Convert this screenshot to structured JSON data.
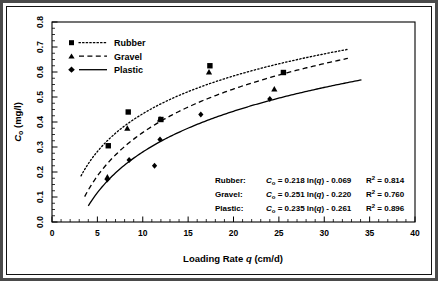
{
  "chart_data": {
    "type": "scatter",
    "title": "",
    "xlabel": "Loading Rate q  (cm/d)",
    "ylabel": "Cₒ  (mg/l)",
    "xlim": [
      0,
      40
    ],
    "ylim": [
      0.0,
      0.8
    ],
    "xticks": [
      0,
      5,
      10,
      15,
      20,
      25,
      30,
      35,
      40
    ],
    "xticklabels": [
      "0",
      "5",
      "10",
      "15",
      "20",
      "25",
      "30",
      "35",
      "40"
    ],
    "yticks": [
      0.0,
      0.1,
      0.2,
      0.3,
      0.4,
      0.5,
      0.6,
      0.7,
      0.8
    ],
    "yticklabels": [
      "0.0",
      "0.1",
      "0.2",
      "0.3",
      "0.4",
      "0.5",
      "0.6",
      "0.7",
      "0.8"
    ],
    "x_minor_step": 1,
    "y_minor_step": 0.025,
    "grid": false,
    "legend_position": "top-left",
    "series": [
      {
        "name": "Rubber",
        "marker": "square",
        "line": "dotted",
        "points": [
          {
            "x": 6.2,
            "y": 0.305
          },
          {
            "x": 8.4,
            "y": 0.44
          },
          {
            "x": 12.0,
            "y": 0.41
          },
          {
            "x": 17.4,
            "y": 0.625
          },
          {
            "x": 25.5,
            "y": 0.598
          }
        ],
        "fit": {
          "slope": 0.218,
          "intercept": -0.069,
          "r2": 0.814,
          "x_start": 3.2,
          "x_end": 32.6
        }
      },
      {
        "name": "Gravel",
        "marker": "triangle",
        "line": "dashed",
        "points": [
          {
            "x": 6.1,
            "y": 0.18
          },
          {
            "x": 8.3,
            "y": 0.375
          },
          {
            "x": 11.9,
            "y": 0.412
          },
          {
            "x": 17.3,
            "y": 0.6
          },
          {
            "x": 24.5,
            "y": 0.532
          }
        ],
        "fit": {
          "slope": 0.251,
          "intercept": -0.22,
          "r2": 0.76,
          "x_start": 3.6,
          "x_end": 32.6
        }
      },
      {
        "name": "Plastic",
        "marker": "diamond",
        "line": "solid",
        "points": [
          {
            "x": 6.1,
            "y": 0.17
          },
          {
            "x": 8.5,
            "y": 0.248
          },
          {
            "x": 11.3,
            "y": 0.225
          },
          {
            "x": 11.9,
            "y": 0.33
          },
          {
            "x": 16.4,
            "y": 0.43
          },
          {
            "x": 24.0,
            "y": 0.492
          }
        ],
        "fit": {
          "slope": 0.235,
          "intercept": -0.261,
          "r2": 0.896,
          "x_start": 4.0,
          "x_end": 34.1
        }
      }
    ]
  },
  "legend": {
    "items": [
      {
        "label": "Rubber"
      },
      {
        "label": "Gravel"
      },
      {
        "label": "Plastic"
      }
    ]
  },
  "equations": {
    "rows": [
      {
        "label": "Rubber:",
        "var": "C",
        "sub": "o",
        "eq_mid": " = 0.218 ln(",
        "eq_var": "q",
        "eq_tail": ") - 0.069",
        "r2_label": "R",
        "r2_exp": "2",
        "r2_value": " = 0.814"
      },
      {
        "label": "Gravel:",
        "var": "C",
        "sub": "o",
        "eq_mid": " = 0.251 ln(",
        "eq_var": "q",
        "eq_tail": ") - 0.220",
        "r2_label": "R",
        "r2_exp": "2",
        "r2_value": " = 0.760"
      },
      {
        "label": "Plastic:",
        "var": "C",
        "sub": "o",
        "eq_mid": " = 0.235 ln(",
        "eq_var": "q",
        "eq_tail": ") - 0.261",
        "r2_label": "R",
        "r2_exp": "2",
        "r2_value": " = 0.896"
      }
    ]
  },
  "axes": {
    "x_title_main": "Loading Rate",
    "x_title_var": "q",
    "x_title_unit": "(cm/d)",
    "y_title_var": "C",
    "y_title_sub": "o",
    "y_title_unit": "(mg/l)"
  }
}
